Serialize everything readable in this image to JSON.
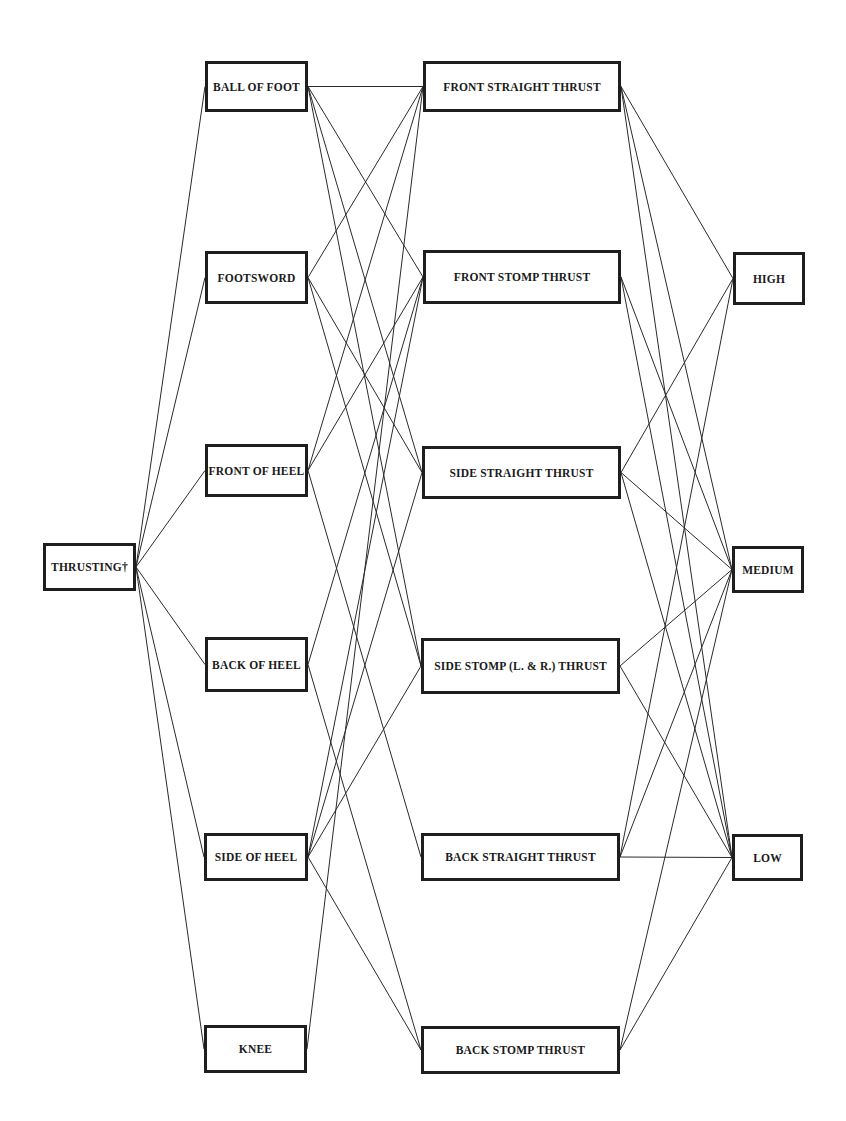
{
  "diagram": {
    "type": "flow-tree",
    "line_color": "#2a2a2a",
    "border_color": "#1e1e1e",
    "root": {
      "id": "thrusting",
      "label": "THRUSTING†",
      "box": [
        43,
        543,
        93,
        48
      ]
    },
    "columns": {
      "weapons": [
        {
          "id": "ball_of_foot",
          "label": "BALL OF FOOT",
          "box": [
            205,
            61,
            103,
            51
          ]
        },
        {
          "id": "footsword",
          "label": "FOOTSWORD",
          "box": [
            205,
            251,
            103,
            53
          ]
        },
        {
          "id": "front_of_heel",
          "label": "FRONT OF HEEL",
          "box": [
            205,
            444,
            103,
            53
          ]
        },
        {
          "id": "back_of_heel",
          "label": "BACK OF HEEL",
          "box": [
            205,
            637,
            103,
            55
          ]
        },
        {
          "id": "side_of_heel",
          "label": "SIDE OF HEEL",
          "box": [
            204,
            833,
            104,
            48
          ]
        },
        {
          "id": "knee",
          "label": "KNEE",
          "box": [
            204,
            1025,
            103,
            48
          ]
        }
      ],
      "kicks": [
        {
          "id": "front_straight",
          "label": "FRONT STRAIGHT THRUST",
          "box": [
            423,
            61,
            198,
            51
          ]
        },
        {
          "id": "front_stomp",
          "label": "FRONT STOMP THRUST",
          "box": [
            423,
            250,
            198,
            54
          ]
        },
        {
          "id": "side_straight",
          "label": "SIDE STRAIGHT THRUST",
          "box": [
            422,
            446,
            199,
            53
          ]
        },
        {
          "id": "side_stomp",
          "label": "SIDE STOMP (L. & R.) THRUST",
          "box": [
            421,
            638,
            199,
            56
          ]
        },
        {
          "id": "back_straight",
          "label": "BACK STRAIGHT THRUST",
          "box": [
            421,
            833,
            199,
            48
          ]
        },
        {
          "id": "back_stomp",
          "label": "BACK STOMP THRUST",
          "box": [
            421,
            1026,
            199,
            48
          ]
        }
      ],
      "heights": [
        {
          "id": "high",
          "label": "HIGH",
          "box": [
            733,
            252,
            72,
            53
          ]
        },
        {
          "id": "medium",
          "label": "MEDIUM",
          "box": [
            732,
            546,
            72,
            47
          ]
        },
        {
          "id": "low",
          "label": "LOW",
          "box": [
            732,
            834,
            71,
            47
          ]
        }
      ]
    },
    "edges": [
      [
        "thrusting",
        "ball_of_foot"
      ],
      [
        "thrusting",
        "footsword"
      ],
      [
        "thrusting",
        "front_of_heel"
      ],
      [
        "thrusting",
        "back_of_heel"
      ],
      [
        "thrusting",
        "side_of_heel"
      ],
      [
        "thrusting",
        "knee"
      ],
      [
        "ball_of_foot",
        "front_straight"
      ],
      [
        "ball_of_foot",
        "front_stomp"
      ],
      [
        "ball_of_foot",
        "side_straight"
      ],
      [
        "ball_of_foot",
        "side_stomp"
      ],
      [
        "footsword",
        "front_straight"
      ],
      [
        "footsword",
        "side_straight"
      ],
      [
        "footsword",
        "side_stomp"
      ],
      [
        "front_of_heel",
        "front_straight"
      ],
      [
        "front_of_heel",
        "front_stomp"
      ],
      [
        "front_of_heel",
        "back_straight"
      ],
      [
        "back_of_heel",
        "front_stomp"
      ],
      [
        "back_of_heel",
        "back_stomp"
      ],
      [
        "side_of_heel",
        "front_stomp"
      ],
      [
        "side_of_heel",
        "side_straight"
      ],
      [
        "side_of_heel",
        "side_stomp"
      ],
      [
        "side_of_heel",
        "back_stomp"
      ],
      [
        "knee",
        "front_straight"
      ],
      [
        "front_straight",
        "high"
      ],
      [
        "front_straight",
        "medium"
      ],
      [
        "front_straight",
        "low"
      ],
      [
        "front_stomp",
        "medium"
      ],
      [
        "front_stomp",
        "low"
      ],
      [
        "side_straight",
        "high"
      ],
      [
        "side_straight",
        "medium"
      ],
      [
        "side_straight",
        "low"
      ],
      [
        "side_stomp",
        "medium"
      ],
      [
        "side_stomp",
        "low"
      ],
      [
        "back_straight",
        "high"
      ],
      [
        "back_straight",
        "medium"
      ],
      [
        "back_straight",
        "low"
      ],
      [
        "back_stomp",
        "medium"
      ],
      [
        "back_stomp",
        "low"
      ]
    ]
  }
}
